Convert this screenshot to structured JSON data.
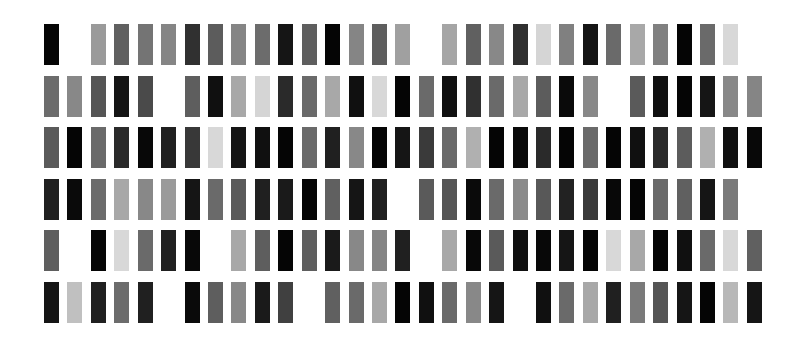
{
  "layout": {
    "origin_x": 44,
    "origin_y": 24,
    "col_pitch": 23.43,
    "row_pitch": 51.6,
    "bar_width": 15,
    "bar_height": 41,
    "columns": 31,
    "rows": 6
  },
  "grid": [
    [
      "#050505",
      null,
      "#9a9a9a",
      "#606060",
      "#747474",
      "#858585",
      "#303030",
      "#5c5c5c",
      "#858585",
      "#6c6c6c",
      "#151515",
      "#5e5e5e",
      "#050505",
      "#858585",
      "#5e5e5e",
      "#a0a0a0",
      null,
      "#a5a5a5",
      "#606060",
      "#888888",
      "#303030",
      "#d5d5d5",
      "#808080",
      "#151515",
      "#6a6a6a",
      "#a8a8a8",
      "#808080",
      "#050505",
      "#6a6a6a",
      "#d8d8d8",
      null
    ],
    [
      "#6c6c6c",
      "#888888",
      "#555555",
      "#151515",
      "#4a4a4a",
      null,
      "#5e5e5e",
      "#101010",
      "#a8a8a8",
      "#d5d5d5",
      "#2a2a2a",
      "#6a6a6a",
      "#a8a8a8",
      "#101010",
      "#d8d8d8",
      "#050505",
      "#6a6a6a",
      "#101010",
      "#303030",
      "#6a6a6a",
      "#a8a8a8",
      "#5c5c5c",
      "#0a0a0a",
      "#888888",
      null,
      "#5a5a5a",
      "#101010",
      "#050505",
      "#151515",
      "#888888",
      "#858585"
    ],
    [
      "#5a5a5a",
      "#050505",
      "#6a6a6a",
      "#2a2a2a",
      "#080808",
      "#202020",
      "#383838",
      "#d8d8d8",
      "#151515",
      "#101010",
      "#050505",
      "#6a6a6a",
      "#202020",
      "#888888",
      "#050505",
      "#151515",
      "#3a3a3a",
      "#6a6a6a",
      "#b0b0b0",
      "#050505",
      "#0a0a0a",
      "#2a2a2a",
      "#050505",
      "#6a6a6a",
      "#050505",
      "#101010",
      "#2a2a2a",
      "#5c5c5c",
      "#b0b0b0",
      "#101010",
      "#080808"
    ],
    [
      "#202020",
      "#0a0a0a",
      "#6c6c6c",
      "#a8a8a8",
      "#888888",
      "#9a9a9a",
      "#151515",
      "#6a6a6a",
      "#5a5a5a",
      "#202020",
      "#1a1a1a",
      "#050505",
      "#606060",
      "#151515",
      "#202020",
      null,
      "#5a5a5a",
      "#555555",
      "#0a0a0a",
      "#6a6a6a",
      "#8a8a8a",
      "#585858",
      "#222222",
      "#3a3a3a",
      "#080808",
      "#050505",
      "#6a6a6a",
      "#606060",
      "#151515",
      "#7a7a7a",
      null
    ],
    [
      "#5e5e5e",
      null,
      "#050505",
      "#d8d8d8",
      "#6a6a6a",
      "#202020",
      "#080808",
      null,
      "#a8a8a8",
      "#5e5e5e",
      "#050505",
      "#5e5e5e",
      "#1a1a1a",
      "#888888",
      "#858585",
      "#202020",
      null,
      "#a8a8a8",
      "#080808",
      "#5a5a5a",
      "#101010",
      "#080808",
      "#151515",
      "#050505",
      "#d8d8d8",
      "#a8a8a8",
      "#050505",
      "#101010",
      "#6a6a6a",
      "#d8d8d8",
      "#606060"
    ],
    [
      "#151515",
      "#c0c0c0",
      "#202020",
      "#6c6c6c",
      "#202020",
      null,
      "#0a0a0a",
      "#5e5e5e",
      "#888888",
      "#1a1a1a",
      "#404040",
      null,
      "#606060",
      "#6a6a6a",
      "#a8a8a8",
      "#050505",
      "#101010",
      "#6a6a6a",
      "#888888",
      "#151515",
      null,
      "#101010",
      "#6a6a6a",
      "#a8a8a8",
      "#202020",
      "#7a7a7a",
      "#555555",
      "#151515",
      "#050505",
      "#b8b8b8",
      "#151515"
    ]
  ]
}
